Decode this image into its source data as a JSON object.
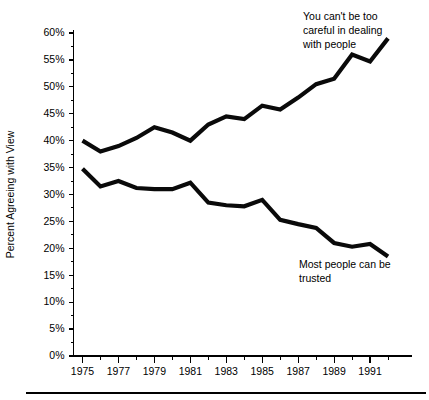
{
  "chart_data": {
    "type": "line",
    "title": "",
    "xlabel": "",
    "ylabel": "Percent Agreeing with View",
    "xlim": [
      1974.5,
      1993.0
    ],
    "ylim": [
      0,
      60
    ],
    "grid": false,
    "legend_position": "inline-annotations",
    "x": [
      1975,
      1976,
      1977,
      1978,
      1979,
      1980,
      1981,
      1982,
      1983,
      1984,
      1985,
      1986,
      1987,
      1988,
      1989,
      1990,
      1991,
      1992
    ],
    "x_tick_labels": [
      "1975",
      "1977",
      "1979",
      "1981",
      "1983",
      "1985",
      "1987",
      "1989",
      "1991"
    ],
    "x_tick_values": [
      1975,
      1977,
      1979,
      1981,
      1983,
      1985,
      1987,
      1989,
      1991
    ],
    "x_minor_tick_values": [
      1976,
      1978,
      1980,
      1982,
      1984,
      1986,
      1988,
      1990,
      1992
    ],
    "y_tick_labels": [
      "0%",
      "5%",
      "10%",
      "15%",
      "20%",
      "25%",
      "30%",
      "35%",
      "40%",
      "45%",
      "50%",
      "55%",
      "60%"
    ],
    "y_tick_values": [
      0,
      5,
      10,
      15,
      20,
      25,
      30,
      35,
      40,
      45,
      50,
      55,
      60
    ],
    "series": [
      {
        "name": "You can't be too careful in dealing with people",
        "color": "#0a0a0a",
        "values": [
          40.0,
          38.0,
          39.0,
          40.5,
          42.5,
          41.5,
          40.0,
          43.0,
          44.5,
          44.0,
          46.5,
          45.8,
          48.0,
          50.5,
          51.5,
          56.0,
          54.7,
          59.0
        ]
      },
      {
        "name": "Most people can be trusted",
        "color": "#0a0a0a",
        "values": [
          34.8,
          31.5,
          32.5,
          31.2,
          31.0,
          31.0,
          32.2,
          28.5,
          28.0,
          27.8,
          29.0,
          25.3,
          24.5,
          23.8,
          21.0,
          20.3,
          20.8,
          18.5
        ]
      }
    ],
    "annotations": [
      {
        "name": "careful-annotation",
        "lines": [
          "You can't be too",
          "careful in dealing",
          "with people"
        ],
        "x": 303,
        "y": 20
      },
      {
        "name": "trusted-annotation",
        "lines": [
          "Most people can be",
          "trusted"
        ],
        "x": 299,
        "y": 268
      }
    ]
  }
}
